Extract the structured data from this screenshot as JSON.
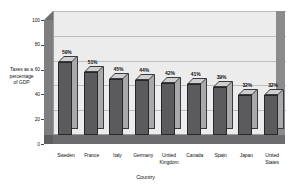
{
  "chart_data": {
    "type": "bar",
    "title": "",
    "xlabel": "Country",
    "ylabel": "Taxes as a percentage of GDP",
    "ylabel_lines": [
      "Taxes as a",
      "percentage",
      "of GDP"
    ],
    "categories": [
      "Sweden",
      "France",
      "Italy",
      "Germany",
      "United Kingdom",
      "Canada",
      "Spain",
      "Japan",
      "United States"
    ],
    "category_lines": [
      [
        "Sweden"
      ],
      [
        "France"
      ],
      [
        "Italy"
      ],
      [
        "Germany"
      ],
      [
        "United",
        "Kingdom"
      ],
      [
        "Canada"
      ],
      [
        "Spain"
      ],
      [
        "Japan"
      ],
      [
        "United",
        "States"
      ]
    ],
    "values": [
      59,
      51,
      45,
      44,
      42,
      41,
      39,
      32,
      32
    ],
    "data_labels": [
      "59%",
      "51%",
      "45%",
      "44%",
      "42%",
      "41%",
      "39%",
      "32%",
      "32%"
    ],
    "ylim": [
      0,
      100
    ],
    "yticks": [
      0,
      20,
      40,
      60,
      80,
      100
    ],
    "ytick_labels": [
      "0",
      "20",
      "40",
      "60",
      "80",
      "100"
    ],
    "grid": true,
    "legend": false,
    "style": "3d-column",
    "colors": {
      "bar_front": "#5b5b5d",
      "bar_side": "#a9a9ab",
      "bar_top": "#cfcfd1",
      "bar_outline": "#272729",
      "back_wall": "#ececed",
      "left_wall": "#7e7e80",
      "right_wall": "#8b8b8d",
      "floor": "#6c6c6e",
      "gridline": "#bdbdbe",
      "text": "#121212"
    }
  }
}
